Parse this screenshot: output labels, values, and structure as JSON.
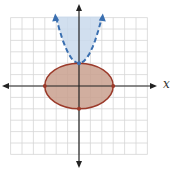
{
  "chart_data": {
    "type": "region-plot",
    "title": "",
    "xlabel": "x",
    "ylabel": "",
    "xlim": [
      -6,
      6
    ],
    "ylim": [
      -6,
      6
    ],
    "grid": true,
    "grid_step": 1,
    "regions": [
      {
        "name": "parabola-region",
        "boundary": "y = x^2 + 2",
        "inequality": "y > x^2 + 2",
        "boundary_style": "dashed",
        "fill": "#c9d9ec",
        "stroke": "#3a6fb0",
        "vertex": [
          0,
          2
        ],
        "arrow_endpoints": [
          [
            -2,
            6
          ],
          [
            2,
            6
          ]
        ]
      },
      {
        "name": "ellipse-region",
        "boundary": "x^2/9 + y^2/4 = 1",
        "inequality": "x^2/9 + y^2/4 <= 1",
        "boundary_style": "solid",
        "fill": "#c9a08e",
        "stroke": "#9b3a2a",
        "center": [
          0,
          0
        ],
        "semi_axes": [
          3,
          2
        ],
        "marked_points": [
          [
            -3,
            0
          ],
          [
            3,
            0
          ],
          [
            0,
            -2
          ],
          [
            0,
            2
          ]
        ]
      }
    ]
  },
  "axis": {
    "x_label": "x"
  },
  "colors": {
    "grid": "#d6d6d6",
    "axis": "#222222",
    "parabola_fill": "#c9d9ec",
    "parabola_stroke": "#3a6fb0",
    "ellipse_fill": "#c9a08e",
    "ellipse_stroke": "#9b3a2a"
  }
}
